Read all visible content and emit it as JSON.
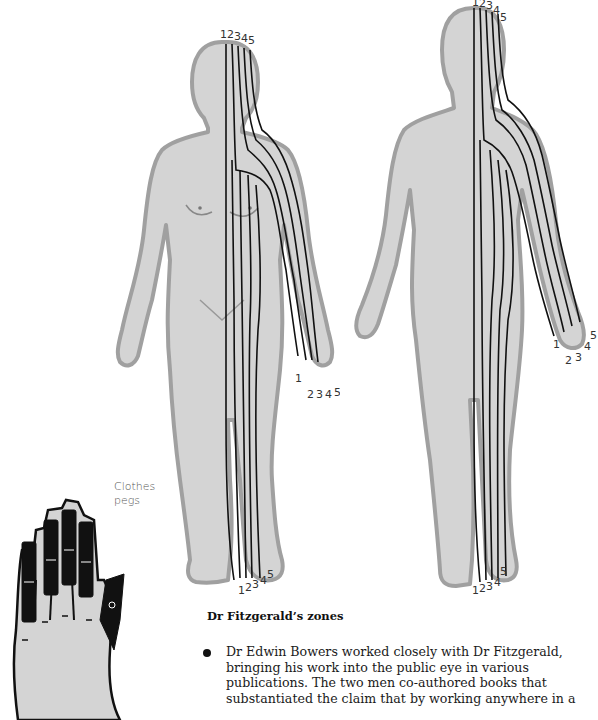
{
  "figures": {
    "front_body": {
      "zone_labels_head": [
        "1",
        "2",
        "3",
        "4",
        "5"
      ],
      "zone_labels_hand": [
        "1",
        "2",
        "3",
        "4",
        "5"
      ],
      "zone_labels_foot": [
        "1",
        "2",
        "3",
        "4",
        "5"
      ]
    },
    "back_body": {
      "zone_labels_head": [
        "1",
        "2",
        "3",
        "4",
        "5"
      ],
      "zone_labels_hand": [
        "1",
        "2",
        "3",
        "4",
        "5"
      ],
      "zone_labels_foot": [
        "1",
        "2",
        "3",
        "4",
        "5"
      ]
    },
    "hand": {
      "label_line1": "Clothes",
      "label_line2": "pegs"
    }
  },
  "caption": "Dr Fitzgerald’s zones",
  "bullet": {
    "text": "Dr Edwin Bowers worked closely with Dr Fitzgerald,\nbringing his work into the public eye in various\npublications. The two men co-authored books that\nsubstantiated the claim that by working anywhere in a"
  },
  "colors": {
    "skin": "#d4d4d4",
    "outline": "#9a9a9a",
    "zone_line": "#111111",
    "text": "#1a1a1a"
  }
}
